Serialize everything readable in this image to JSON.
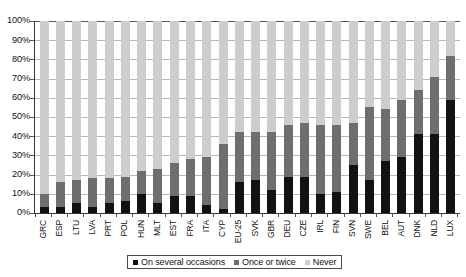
{
  "chart_data": {
    "type": "bar",
    "subtype": "stacked-bar-100",
    "title": "",
    "xlabel": "",
    "ylabel": "",
    "ylim": [
      0,
      100
    ],
    "yticks": [
      "0%",
      "10%",
      "20%",
      "30%",
      "40%",
      "50%",
      "60%",
      "70%",
      "80%",
      "90%",
      "100%"
    ],
    "ytick_values": [
      0,
      10,
      20,
      30,
      40,
      50,
      60,
      70,
      80,
      90,
      100
    ],
    "grid": true,
    "legend_position": "bottom",
    "categories": [
      "GRC",
      "ESP",
      "LTU",
      "LVA",
      "PRT",
      "POL",
      "HUN",
      "MLT",
      "EST",
      "FRA",
      "ITA",
      "CYP",
      "EU-25",
      "SVK",
      "GBR",
      "DEU",
      "CZE",
      "IRL",
      "FIN",
      "SVN",
      "SWE",
      "BEL",
      "AUT",
      "DNK",
      "NLD",
      "LUX"
    ],
    "series": [
      {
        "name": "On several occasions",
        "color": "#121212",
        "values": [
          3,
          3,
          5,
          3,
          5,
          6,
          10,
          5,
          9,
          9,
          4,
          2,
          16,
          17,
          12,
          19,
          19,
          10,
          11,
          25,
          17,
          27,
          29,
          41,
          41,
          59
        ]
      },
      {
        "name": "Once or twice",
        "color": "#6e6e6e",
        "values": [
          7,
          13,
          12,
          15,
          13,
          13,
          12,
          18,
          17,
          19,
          25,
          34,
          26,
          25,
          30,
          27,
          28,
          36,
          35,
          22,
          38,
          27,
          30,
          23,
          30,
          23
        ]
      },
      {
        "name": "Never",
        "color": "#cdcdcd",
        "values": [
          90,
          84,
          83,
          82,
          82,
          81,
          78,
          77,
          74,
          72,
          71,
          64,
          58,
          58,
          58,
          54,
          53,
          54,
          54,
          53,
          45,
          46,
          41,
          36,
          29,
          18
        ]
      }
    ],
    "legend": [
      {
        "label": "On several occasions",
        "color": "#121212"
      },
      {
        "label": "Once or twice",
        "color": "#6e6e6e"
      },
      {
        "label": "Never",
        "color": "#cdcdcd"
      }
    ]
  }
}
